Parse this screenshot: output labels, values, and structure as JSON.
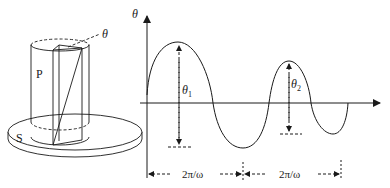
{
  "apparatus": {
    "label_P": "P",
    "label_S": "S",
    "label_theta": "θ"
  },
  "graph": {
    "y_axis_label": "θ",
    "amplitude_1": {
      "symbol": "θ",
      "subscript": "1"
    },
    "amplitude_2": {
      "symbol": "θ",
      "subscript": "2"
    },
    "period_1": "2π/ω",
    "period_2": "2π/ω"
  },
  "colors": {
    "stroke": "#1a1a1a",
    "background": "#ffffff"
  }
}
